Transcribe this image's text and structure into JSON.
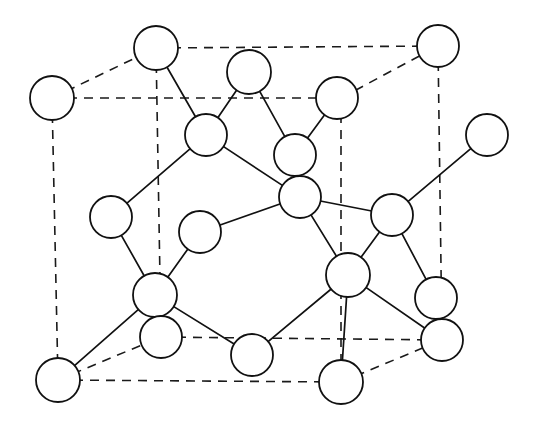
{
  "figure": {
    "type": "diagram",
    "background_color": "#ffffff",
    "line_color": "#111111",
    "atom_fill_color": "#ffffff",
    "atom_stroke_color": "#111111",
    "dashed_edge_color": "#1a1a1a",
    "canvas": {
      "width": 538,
      "height": 428
    }
  },
  "geometry": {
    "cube_front_face": [
      {
        "name": "front-top-left",
        "x": 52,
        "y": 98
      },
      {
        "name": "front-top-right",
        "x": 341,
        "y": 98
      },
      {
        "name": "front-bottom-right",
        "x": 341,
        "y": 382
      },
      {
        "name": "front-bottom-left",
        "x": 58,
        "y": 380
      }
    ],
    "cube_back_face": [
      {
        "name": "back-top-left",
        "x": 156,
        "y": 48
      },
      {
        "name": "back-top-right",
        "x": 438,
        "y": 46
      },
      {
        "name": "back-bottom-right",
        "x": 442,
        "y": 340
      },
      {
        "name": "back-bottom-left",
        "x": 161,
        "y": 337
      }
    ],
    "dashed_edges": [
      [
        52,
        98,
        341,
        98
      ],
      [
        52,
        98,
        58,
        380
      ],
      [
        58,
        380,
        341,
        382
      ],
      [
        341,
        98,
        341,
        382
      ],
      [
        156,
        48,
        438,
        46
      ],
      [
        156,
        48,
        161,
        337
      ],
      [
        161,
        337,
        442,
        340
      ],
      [
        438,
        46,
        442,
        340
      ],
      [
        52,
        98,
        156,
        48
      ],
      [
        341,
        98,
        438,
        46
      ],
      [
        341,
        382,
        442,
        340
      ],
      [
        58,
        380,
        161,
        337
      ]
    ],
    "atoms": [
      {
        "id": "a1",
        "label": "back-top-left-corner",
        "x": 156,
        "y": 48,
        "r": 22
      },
      {
        "id": "a2",
        "label": "back-top-right-corner",
        "x": 438,
        "y": 46,
        "r": 21
      },
      {
        "id": "a3",
        "label": "front-top-left-corner",
        "x": 52,
        "y": 98,
        "r": 22
      },
      {
        "id": "a4",
        "label": "back-top-face-center",
        "x": 249,
        "y": 72,
        "r": 22
      },
      {
        "id": "a5",
        "label": "top-face-center-right",
        "x": 337,
        "y": 98,
        "r": 21
      },
      {
        "id": "a6",
        "label": "upper-tetrahedral-left",
        "x": 206,
        "y": 135,
        "r": 21
      },
      {
        "id": "a7",
        "label": "upper-tetrahedral-center",
        "x": 295,
        "y": 155,
        "r": 21
      },
      {
        "id": "a8",
        "label": "right-outer-atom",
        "x": 487,
        "y": 135,
        "r": 21
      },
      {
        "id": "a9",
        "label": "mid-right-overlap-atom",
        "x": 300,
        "y": 197,
        "r": 21
      },
      {
        "id": "a10",
        "label": "left-face-center",
        "x": 111,
        "y": 217,
        "r": 21
      },
      {
        "id": "a11",
        "label": "interior-free-atom",
        "x": 200,
        "y": 232,
        "r": 21
      },
      {
        "id": "a12",
        "label": "right-face-center",
        "x": 392,
        "y": 215,
        "r": 21
      },
      {
        "id": "a13",
        "label": "lower-tetrahedral-left",
        "x": 155,
        "y": 295,
        "r": 22
      },
      {
        "id": "a14",
        "label": "lower-tetrahedral-right",
        "x": 348,
        "y": 275,
        "r": 22
      },
      {
        "id": "a15",
        "label": "back-bottom-left-corner",
        "x": 161,
        "y": 337,
        "r": 21
      },
      {
        "id": "a16",
        "label": "right-lower-overlap-upper",
        "x": 436,
        "y": 298,
        "r": 21
      },
      {
        "id": "a17",
        "label": "back-bottom-right-corner",
        "x": 442,
        "y": 340,
        "r": 21
      },
      {
        "id": "a18",
        "label": "front-bottom-left-corner",
        "x": 58,
        "y": 380,
        "r": 22
      },
      {
        "id": "a19",
        "label": "bottom-face-center",
        "x": 252,
        "y": 355,
        "r": 21
      },
      {
        "id": "a20",
        "label": "front-bottom-right-corner",
        "x": 341,
        "y": 382,
        "r": 22
      }
    ],
    "bonds": [
      {
        "from": "a1",
        "to": "a6"
      },
      {
        "from": "a4",
        "to": "a6"
      },
      {
        "from": "a4",
        "to": "a7"
      },
      {
        "from": "a5",
        "to": "a7"
      },
      {
        "from": "a6",
        "to": "a10"
      },
      {
        "from": "a6",
        "to": "a9"
      },
      {
        "from": "a7",
        "to": "a9"
      },
      {
        "from": "a9",
        "to": "a11"
      },
      {
        "from": "a9",
        "to": "a12"
      },
      {
        "from": "a9",
        "to": "a14"
      },
      {
        "from": "a8",
        "to": "a12"
      },
      {
        "from": "a12",
        "to": "a16"
      },
      {
        "from": "a10",
        "to": "a13"
      },
      {
        "from": "a11",
        "to": "a13"
      },
      {
        "from": "a13",
        "to": "a15"
      },
      {
        "from": "a13",
        "to": "a18"
      },
      {
        "from": "a13",
        "to": "a19"
      },
      {
        "from": "a14",
        "to": "a17"
      },
      {
        "from": "a14",
        "to": "a19"
      },
      {
        "from": "a14",
        "to": "a20"
      },
      {
        "from": "a12",
        "to": "a14"
      }
    ]
  },
  "legend": {
    "caption": ""
  }
}
